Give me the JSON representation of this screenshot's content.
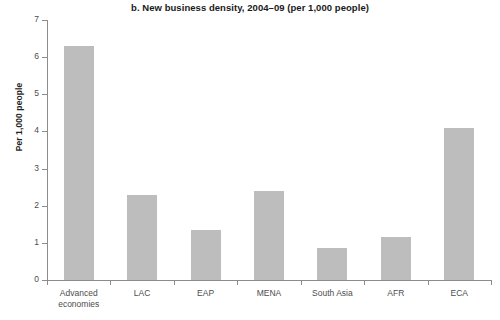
{
  "chart_data": {
    "type": "bar",
    "title": "b. New business density, 2004–09 (per 1,000 people)",
    "xlabel": "",
    "ylabel": "Per 1,000 people",
    "ylim": [
      0,
      7
    ],
    "ytick_values": [
      0,
      1,
      2,
      3,
      4,
      5,
      6,
      7
    ],
    "ytick_labels": [
      "0",
      "1",
      "2",
      "3",
      "4",
      "5",
      "6",
      "7"
    ],
    "grid": false,
    "legend": false,
    "bar_color": "#bdbdbd",
    "axis_color": "#8c8c8c",
    "categories": [
      "Advanced economies",
      "LAC",
      "EAP",
      "MENA",
      "South Asia",
      "AFR",
      "ECA"
    ],
    "category_lines": [
      [
        "Advanced",
        "economies"
      ],
      [
        "LAC"
      ],
      [
        "EAP"
      ],
      [
        "MENA"
      ],
      [
        "South Asia"
      ],
      [
        "AFR"
      ],
      [
        "ECA"
      ]
    ],
    "values": [
      6.3,
      2.3,
      1.35,
      2.4,
      0.85,
      1.15,
      4.1
    ]
  }
}
